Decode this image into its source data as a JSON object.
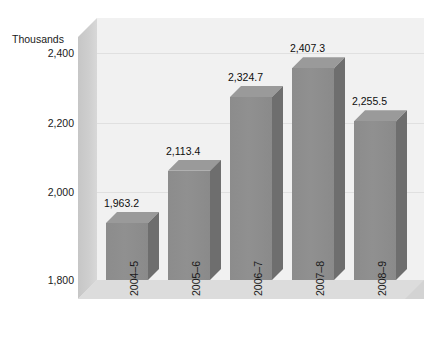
{
  "chart_data": {
    "type": "bar",
    "title": "",
    "subtitle": "",
    "xlabel": "",
    "ylabel": "Thousands",
    "categories": [
      "2004–5",
      "2005–6",
      "2006–7",
      "2007–8",
      "2008–9"
    ],
    "values": [
      1963.2,
      2113.4,
      2324.7,
      2407.3,
      2255.5
    ],
    "value_labels": [
      "1,963.2",
      "2,113.4",
      "2,324.7",
      "2,407.3",
      "2,255.5"
    ],
    "ylim": [
      1800,
      2500
    ],
    "y_ticks": [
      1800,
      2000,
      2200,
      2400
    ],
    "y_tick_labels": [
      "1,800",
      "2,000",
      "2,200",
      "2,400"
    ],
    "grid": true,
    "legend": "none",
    "three_d": true,
    "series": [
      {
        "name": "",
        "values": [
          1963.2,
          2113.4,
          2324.7,
          2407.3,
          2255.5
        ]
      }
    ]
  },
  "colors": {
    "bar_front": "#8c8c8c",
    "bar_side": "#6e6e6e",
    "bar_top": "#a0a0a0",
    "plot_background": "#f1f1f1",
    "wall": "#cdcdcd",
    "floor": "#d7d7d7",
    "gridline": "#e0e0e0",
    "text": "#1a1a1a",
    "page_background": "#ffffff"
  }
}
